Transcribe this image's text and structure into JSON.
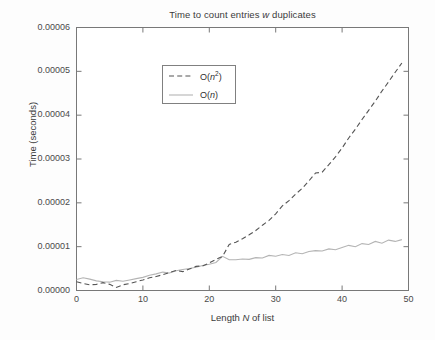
{
  "chart_data": {
    "type": "line",
    "title": "Time to count entries w duplicates",
    "title_parts": {
      "before": "Time to count entries ",
      "italic": "w",
      "after": " duplicates"
    },
    "xlabel": "Length N of list",
    "xlabel_parts": {
      "before": "Length ",
      "italic": "N",
      "after": " of list"
    },
    "ylabel": "Time (seconds)",
    "xlim": [
      0,
      50
    ],
    "ylim": [
      0,
      6e-05
    ],
    "grid": false,
    "legend_position": "upper left",
    "xticks": [
      0,
      10,
      20,
      30,
      40,
      50
    ],
    "xtick_labels": [
      "0",
      "10",
      "20",
      "30",
      "40",
      "50"
    ],
    "yticks": [
      0,
      1e-05,
      2e-05,
      3e-05,
      4e-05,
      5e-05,
      6e-05
    ],
    "ytick_labels": [
      "0.00000",
      "0.00001",
      "0.00002",
      "0.00003",
      "0.00004",
      "0.00005",
      "0.00006"
    ],
    "x": [
      0,
      1,
      2,
      3,
      4,
      5,
      6,
      7,
      8,
      9,
      10,
      11,
      12,
      13,
      14,
      15,
      16,
      17,
      18,
      19,
      20,
      21,
      22,
      23,
      24,
      25,
      26,
      27,
      28,
      29,
      30,
      31,
      32,
      33,
      34,
      35,
      36,
      37,
      38,
      39,
      40,
      41,
      42,
      43,
      44,
      45,
      46,
      47,
      48,
      49
    ],
    "series": [
      {
        "name": "O(n^2)",
        "label_parts": {
          "before": "O(",
          "italic": "n",
          "sup": "2",
          "after": ")"
        },
        "style": "dashed",
        "color": "#555555",
        "values": [
          2e-06,
          1.6e-06,
          1.3e-06,
          1.4e-06,
          1.8e-06,
          1.4e-06,
          7e-07,
          1.3e-06,
          1.6e-06,
          2e-06,
          2.4e-06,
          2.9e-06,
          3.2e-06,
          3.6e-06,
          4.1e-06,
          4.6e-06,
          4.3e-06,
          4.9e-06,
          5.5e-06,
          5.6e-06,
          6.3e-06,
          7.1e-06,
          7.8e-06,
          1.05e-05,
          1.1e-05,
          1.18e-05,
          1.27e-05,
          1.37e-05,
          1.49e-05,
          1.6e-05,
          1.75e-05,
          1.93e-05,
          2.05e-05,
          2.2e-05,
          2.33e-05,
          2.5e-05,
          2.68e-05,
          2.7e-05,
          2.87e-05,
          3.05e-05,
          3.25e-05,
          3.48e-05,
          3.68e-05,
          3.9e-05,
          4.11e-05,
          4.32e-05,
          4.55e-05,
          4.76e-05,
          4.98e-05,
          5.19e-05
        ]
      },
      {
        "name": "O(n)",
        "label_parts": {
          "before": "O(",
          "italic": "n",
          "sup": "",
          "after": ")"
        },
        "style": "solid",
        "color": "#b4b4b4",
        "values": [
          2.5e-06,
          2.9e-06,
          2.6e-06,
          2.2e-06,
          2e-06,
          1.9e-06,
          2.3e-06,
          2.1e-06,
          2.4e-06,
          2.7e-06,
          3e-06,
          3.5e-06,
          3.8e-06,
          4.2e-06,
          4e-06,
          4.5e-06,
          4.8e-06,
          5e-06,
          5.3e-06,
          5.7e-06,
          6e-06,
          6.4e-06,
          7.8e-06,
          7e-06,
          7e-06,
          7.2e-06,
          7.1e-06,
          7.5e-06,
          7.4e-06,
          8e-06,
          7.8e-06,
          8.2e-06,
          8e-06,
          8.6e-06,
          8.4e-06,
          8.9e-06,
          9.1e-06,
          9e-06,
          9.5e-06,
          9.3e-06,
          9.8e-06,
          1.03e-05,
          1e-05,
          1.07e-05,
          1.05e-05,
          1.12e-05,
          1.08e-05,
          1.15e-05,
          1.12e-05,
          1.16e-05
        ]
      }
    ]
  },
  "legend": {
    "items": [
      {
        "text": "O(n2)"
      },
      {
        "text": "O(n)"
      }
    ]
  }
}
